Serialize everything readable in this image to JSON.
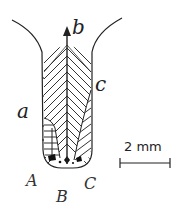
{
  "figure": {
    "type": "botanical shoot-apex / leaf-primordia diagram",
    "labels": {
      "a": "a",
      "b": "b",
      "c": "c",
      "A": "A",
      "B": "B",
      "C": "C"
    },
    "scale_bar": {
      "label": "2 mm",
      "length_value": 2,
      "unit": "mm"
    },
    "arrow": {
      "direction": "up",
      "label_ref": "b"
    },
    "colors": {
      "ink": "#222222",
      "background": "#ffffff"
    }
  }
}
